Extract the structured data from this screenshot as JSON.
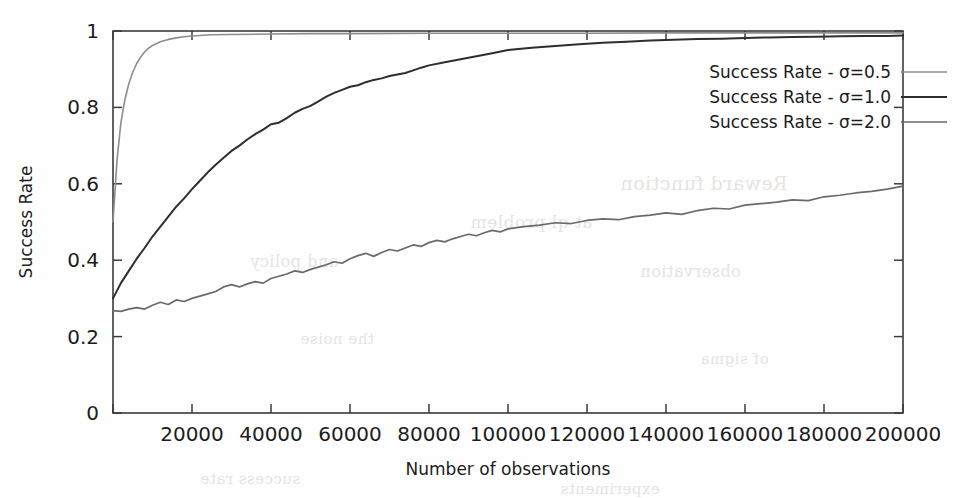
{
  "figure": {
    "width": 967,
    "height": 498,
    "background": "#fefefe",
    "frame_color": "#3b3b3b"
  },
  "plot_area": {
    "left": 113,
    "top": 31,
    "right": 903,
    "bottom": 413
  },
  "ghost_text": [
    {
      "text": "Reward function",
      "x": 620,
      "y": 172,
      "size": 19
    },
    {
      "text": "at ql problem",
      "x": 470,
      "y": 212,
      "size": 17
    },
    {
      "text": "and policy",
      "x": 250,
      "y": 252,
      "size": 16
    },
    {
      "text": "observation",
      "x": 640,
      "y": 262,
      "size": 16
    },
    {
      "text": "the noise",
      "x": 300,
      "y": 330,
      "size": 15
    },
    {
      "text": "of sigma",
      "x": 700,
      "y": 350,
      "size": 15
    },
    {
      "text": "success rate",
      "x": 200,
      "y": 470,
      "size": 15
    },
    {
      "text": "experiments",
      "x": 560,
      "y": 480,
      "size": 15
    }
  ],
  "chart_data": {
    "type": "line",
    "title": "",
    "xlabel": "Number of observations",
    "ylabel": "Success Rate",
    "xlim": [
      0,
      200000
    ],
    "ylim": [
      0,
      1
    ],
    "grid": false,
    "legend_position": "top-right",
    "xticks": [
      0,
      20000,
      40000,
      60000,
      80000,
      100000,
      120000,
      140000,
      160000,
      180000,
      200000
    ],
    "xtick_labels": [
      "",
      "20000",
      "40000",
      "60000",
      "80000",
      "100000",
      "120000",
      "140000",
      "160000",
      "180000",
      "200000"
    ],
    "yticks": [
      0,
      0.2,
      0.4,
      0.6,
      0.8,
      1
    ],
    "ytick_labels": [
      "0",
      "0.2",
      "0.4",
      "0.6",
      "0.8",
      "1"
    ],
    "series": [
      {
        "name": "Success Rate - σ=0.5",
        "color": "#8d8d8d",
        "width": 1.6,
        "x": [
          0,
          1000,
          2000,
          3000,
          4000,
          5000,
          6000,
          7000,
          8000,
          9000,
          10000,
          12000,
          14000,
          16000,
          18000,
          20000,
          25000,
          30000,
          40000,
          50000,
          60000,
          80000,
          100000,
          120000,
          140000,
          160000,
          180000,
          200000
        ],
        "values": [
          0.5,
          0.66,
          0.76,
          0.82,
          0.862,
          0.892,
          0.915,
          0.932,
          0.945,
          0.955,
          0.962,
          0.972,
          0.978,
          0.982,
          0.985,
          0.987,
          0.99,
          0.991,
          0.992,
          0.993,
          0.993,
          0.994,
          0.994,
          0.994,
          0.995,
          0.995,
          0.995,
          0.995
        ]
      },
      {
        "name": "Success Rate - σ=1.0",
        "color": "#2e2e2e",
        "width": 2.0,
        "x": [
          0,
          2000,
          4000,
          6000,
          8000,
          10000,
          12000,
          14000,
          16000,
          18000,
          20000,
          22000,
          24000,
          26000,
          28000,
          30000,
          32000,
          34000,
          36000,
          38000,
          40000,
          42000,
          44000,
          46000,
          48000,
          50000,
          52000,
          54000,
          56000,
          58000,
          60000,
          62000,
          64000,
          66000,
          68000,
          70000,
          72000,
          74000,
          76000,
          78000,
          80000,
          84000,
          88000,
          92000,
          96000,
          100000,
          106000,
          112000,
          118000,
          124000,
          130000,
          136000,
          142000,
          148000,
          154000,
          160000,
          166000,
          172000,
          178000,
          184000,
          190000,
          196000,
          200000
        ],
        "values": [
          0.3,
          0.34,
          0.372,
          0.404,
          0.432,
          0.462,
          0.488,
          0.514,
          0.54,
          0.562,
          0.586,
          0.608,
          0.63,
          0.65,
          0.668,
          0.686,
          0.7,
          0.716,
          0.73,
          0.742,
          0.756,
          0.76,
          0.772,
          0.786,
          0.796,
          0.804,
          0.816,
          0.828,
          0.838,
          0.846,
          0.854,
          0.858,
          0.866,
          0.872,
          0.876,
          0.882,
          0.886,
          0.89,
          0.897,
          0.904,
          0.91,
          0.918,
          0.926,
          0.934,
          0.942,
          0.95,
          0.956,
          0.961,
          0.965,
          0.969,
          0.972,
          0.975,
          0.977,
          0.979,
          0.98,
          0.982,
          0.983,
          0.984,
          0.985,
          0.986,
          0.987,
          0.987,
          0.988
        ]
      },
      {
        "name": "Success Rate - σ=2.0",
        "color": "#6a6a6a",
        "width": 1.7,
        "x": [
          0,
          2000,
          4000,
          6000,
          8000,
          10000,
          12000,
          14000,
          16000,
          18000,
          20000,
          22000,
          24000,
          26000,
          28000,
          30000,
          32000,
          34000,
          36000,
          38000,
          40000,
          42000,
          44000,
          46000,
          48000,
          50000,
          52000,
          54000,
          56000,
          58000,
          60000,
          62000,
          64000,
          66000,
          68000,
          70000,
          72000,
          74000,
          76000,
          78000,
          80000,
          82000,
          84000,
          86000,
          88000,
          90000,
          92000,
          94000,
          96000,
          98000,
          100000,
          104000,
          108000,
          112000,
          116000,
          120000,
          124000,
          128000,
          132000,
          136000,
          140000,
          144000,
          148000,
          152000,
          156000,
          160000,
          164000,
          168000,
          172000,
          176000,
          180000,
          184000,
          188000,
          192000,
          196000,
          200000
        ],
        "values": [
          0.268,
          0.266,
          0.272,
          0.276,
          0.272,
          0.282,
          0.29,
          0.284,
          0.296,
          0.292,
          0.3,
          0.306,
          0.312,
          0.318,
          0.33,
          0.336,
          0.33,
          0.338,
          0.344,
          0.34,
          0.352,
          0.358,
          0.364,
          0.372,
          0.368,
          0.376,
          0.382,
          0.388,
          0.396,
          0.392,
          0.404,
          0.412,
          0.418,
          0.41,
          0.42,
          0.428,
          0.424,
          0.432,
          0.44,
          0.436,
          0.446,
          0.452,
          0.448,
          0.456,
          0.462,
          0.468,
          0.464,
          0.472,
          0.478,
          0.474,
          0.482,
          0.488,
          0.492,
          0.498,
          0.496,
          0.504,
          0.508,
          0.506,
          0.514,
          0.518,
          0.524,
          0.52,
          0.53,
          0.536,
          0.534,
          0.544,
          0.548,
          0.552,
          0.558,
          0.556,
          0.566,
          0.57,
          0.576,
          0.58,
          0.586,
          0.594
        ]
      }
    ]
  }
}
